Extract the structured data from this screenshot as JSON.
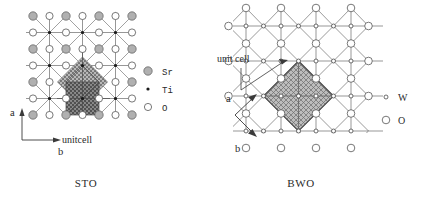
{
  "figure": {
    "background": "#ffffff",
    "ink": "#2a2a2a"
  },
  "panels": [
    {
      "id": "sto",
      "caption": "STO",
      "unitcell_label": "unitcell",
      "axes": {
        "style": "L",
        "a_label": "a",
        "b_label": "b",
        "a_direction": "up",
        "b_direction": "right"
      },
      "legend": [
        {
          "symbol": "sr-circle",
          "label": "Sr",
          "fill": "#b0b0b0",
          "stroke": "#555555",
          "radius": 4.2
        },
        {
          "symbol": "ti-dot",
          "label": "Ti",
          "fill": "#1a1a1a",
          "stroke": "#1a1a1a",
          "radius": 1.5
        },
        {
          "symbol": "o-circle",
          "label": "O",
          "fill": "#ffffff",
          "stroke": "#555555",
          "radius": 3.6
        }
      ],
      "lattice": {
        "type": "perovskite-ab-plane",
        "cols": 7,
        "rows": 7,
        "spacing": 16.5,
        "origin_x": 33,
        "origin_y": 16,
        "description": "alternating Sr/O rows with Ti at cell centers joined by diagonal Ti-O bonds"
      },
      "unit_cell": {
        "shape": "diamond-plus-square",
        "fill": "#9a9a9a",
        "hatch": "dotted",
        "center_x": 74,
        "center_y": 82,
        "diamond_half": 25,
        "square_size": 27
      }
    },
    {
      "id": "bwo",
      "caption": "BWO",
      "unitcell_label": "unit cell",
      "axes": {
        "style": "V",
        "a_label": "a",
        "b_label": "b",
        "a_direction": "up-right",
        "b_direction": "down-right"
      },
      "legend": [
        {
          "symbol": "w-dot",
          "label": "W",
          "fill": "#ffffff",
          "stroke": "#4a4a4a",
          "radius": 1.9
        },
        {
          "symbol": "o-circle",
          "label": "O",
          "fill": "#ffffff",
          "stroke": "#555555",
          "radius": 3.8
        }
      ],
      "lattice": {
        "type": "tungstate-ab-plane",
        "cols": 8,
        "rows": 7,
        "spacing": 17.5,
        "origin_x": 246,
        "origin_y": 16,
        "description": "square net of W sites with O at nodes and diagonal W-O-W bonds"
      },
      "unit_cell": {
        "shape": "diamond",
        "fill": "#9a9a9a",
        "hatch": "cross-dotted",
        "center_x": 290,
        "center_y": 88,
        "half_diagonal": 36
      }
    }
  ]
}
